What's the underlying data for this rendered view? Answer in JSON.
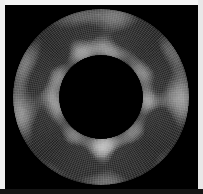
{
  "figure": {
    "kind": "annulus-mesh-field-plot",
    "title": "",
    "width": 203,
    "height": 194,
    "background_color": "#000000",
    "frame": {
      "top_color": "#f4f4f4",
      "left_color": "#f0f0f0",
      "right_color": "#e8e8e8",
      "bottom_color": "#141414",
      "thickness_px": 5
    }
  },
  "chart_data": {
    "type": "heatmap",
    "title": "",
    "subtitle": "",
    "xlabel": "",
    "ylabel": "",
    "legend": [],
    "grid": true,
    "annotations": [],
    "geometry": {
      "shape": "annulus",
      "center_x": 96,
      "center_y": 92,
      "outer_radius": 88,
      "inner_radius": 42,
      "radial_cells": 26,
      "angular_cells": 200
    },
    "axis_ranges": {
      "x": [
        -1.0,
        1.0
      ],
      "y": [
        -1.0,
        1.0
      ]
    },
    "colormap": {
      "name": "grayscale",
      "low_color": "#1d1d1d",
      "mid_color": "#9a9a9a",
      "high_color": "#f2f2f2",
      "vmin": 0.0,
      "vmax": 1.0
    },
    "mesh": {
      "visible": true,
      "line_color": "#cfcfcf",
      "radial_line_count": 200,
      "circumferential_line_count": 26,
      "line_opacity": 0.55
    },
    "field_blobs": [
      {
        "angle_deg": 84,
        "radius_frac": 0.62,
        "size": 0.22,
        "value": 0.17
      },
      {
        "angle_deg": 72,
        "radius_frac": 0.4,
        "size": 0.14,
        "value": 0.14
      },
      {
        "angle_deg": 62,
        "radius_frac": 0.74,
        "size": 0.17,
        "value": 0.2
      },
      {
        "angle_deg": 50,
        "radius_frac": 0.45,
        "size": 0.19,
        "value": 0.16
      },
      {
        "angle_deg": 36,
        "radius_frac": 0.66,
        "size": 0.21,
        "value": 0.18
      },
      {
        "angle_deg": 22,
        "radius_frac": 0.38,
        "size": 0.16,
        "value": 0.15
      },
      {
        "angle_deg": 8,
        "radius_frac": 0.55,
        "size": 0.24,
        "value": 0.12
      },
      {
        "angle_deg": 352,
        "radius_frac": 0.33,
        "size": 0.15,
        "value": 0.19
      },
      {
        "angle_deg": 336,
        "radius_frac": 0.6,
        "size": 0.2,
        "value": 0.16
      },
      {
        "angle_deg": 320,
        "radius_frac": 0.42,
        "size": 0.18,
        "value": 0.14
      },
      {
        "angle_deg": 303,
        "radius_frac": 0.68,
        "size": 0.22,
        "value": 0.18
      },
      {
        "angle_deg": 288,
        "radius_frac": 0.37,
        "size": 0.16,
        "value": 0.15
      },
      {
        "angle_deg": 272,
        "radius_frac": 0.58,
        "size": 0.23,
        "value": 0.13
      },
      {
        "angle_deg": 256,
        "radius_frac": 0.44,
        "size": 0.18,
        "value": 0.17
      },
      {
        "angle_deg": 240,
        "radius_frac": 0.7,
        "size": 0.2,
        "value": 0.16
      },
      {
        "angle_deg": 226,
        "radius_frac": 0.36,
        "size": 0.15,
        "value": 0.14
      },
      {
        "angle_deg": 210,
        "radius_frac": 0.56,
        "size": 0.21,
        "value": 0.18
      },
      {
        "angle_deg": 196,
        "radius_frac": 0.41,
        "size": 0.17,
        "value": 0.15
      },
      {
        "angle_deg": 182,
        "radius_frac": 0.63,
        "size": 0.19,
        "value": 0.13
      },
      {
        "angle_deg": 168,
        "radius_frac": 0.34,
        "size": 0.16,
        "value": 0.18
      },
      {
        "angle_deg": 154,
        "radius_frac": 0.57,
        "size": 0.22,
        "value": 0.15
      },
      {
        "angle_deg": 140,
        "radius_frac": 0.43,
        "size": 0.18,
        "value": 0.16
      },
      {
        "angle_deg": 126,
        "radius_frac": 0.69,
        "size": 0.2,
        "value": 0.14
      },
      {
        "angle_deg": 112,
        "radius_frac": 0.39,
        "size": 0.17,
        "value": 0.19
      },
      {
        "angle_deg": 98,
        "radius_frac": 0.59,
        "size": 0.21,
        "value": 0.15
      }
    ],
    "bright_ridges": [
      {
        "angle_deg": 180,
        "radius_frac": 0.5,
        "intensity": 0.96
      },
      {
        "angle_deg": 90,
        "radius_frac": 0.5,
        "intensity": 0.88
      },
      {
        "angle_deg": 270,
        "radius_frac": 0.52,
        "intensity": 0.9
      },
      {
        "angle_deg": 0,
        "radius_frac": 0.5,
        "intensity": 0.85
      }
    ]
  }
}
